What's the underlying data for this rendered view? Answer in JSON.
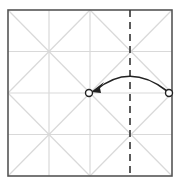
{
  "diagram": {
    "type": "origami-fold-step",
    "square": {
      "x": 8,
      "y": 10,
      "size": 164,
      "stroke": "#555555"
    },
    "crease_color": "#d9d9d9",
    "grid_divisions": 4,
    "valley_fold_line": {
      "x": 130,
      "style": "dashed",
      "color": "#333333"
    },
    "move_arrow": {
      "from": [
        169,
        93
      ],
      "to": [
        89,
        93
      ],
      "color": "#222222"
    },
    "points": [
      {
        "name": "start-point",
        "x": 169,
        "y": 93
      },
      {
        "name": "target-point",
        "x": 89,
        "y": 93
      }
    ]
  }
}
